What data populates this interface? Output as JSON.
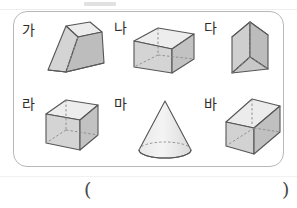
{
  "worksheet": {
    "answer_blank": {
      "open_paren": "(",
      "close_paren": ")"
    },
    "panel": {
      "border_color": "#b8b8b8",
      "background": "#ffffff"
    },
    "palette": {
      "outline": "#555555",
      "hidden_edge": "#8a8a8a",
      "face_top": "#ececec",
      "face_front": "#d6d6d6",
      "face_side": "#bfbfbf",
      "face_light": "#f2f2f2"
    },
    "items": [
      {
        "label": "가",
        "shape": "truncated-square-pyramid",
        "shape_name_en": "frustum of a square pyramid",
        "row": 1,
        "column": 1
      },
      {
        "label": "나",
        "shape": "rectangular-prism-wide",
        "shape_name_en": "cuboid (wide rectangular prism)",
        "row": 1,
        "column": 2
      },
      {
        "label": "다",
        "shape": "triangular-prism",
        "shape_name_en": "triangular prism",
        "row": 1,
        "column": 3
      },
      {
        "label": "라",
        "shape": "cube",
        "shape_name_en": "cube",
        "row": 2,
        "column": 1
      },
      {
        "label": "마",
        "shape": "cone",
        "shape_name_en": "cone",
        "row": 2,
        "column": 2
      },
      {
        "label": "바",
        "shape": "rectangular-prism-long",
        "shape_name_en": "elongated rectangular prism",
        "row": 2,
        "column": 3
      }
    ]
  }
}
